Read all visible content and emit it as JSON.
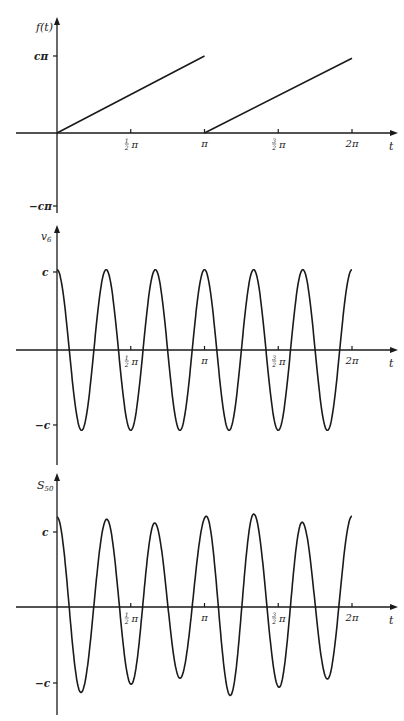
{
  "chart_data": [
    {
      "type": "line",
      "title": "",
      "ylabel": "f(t)",
      "xlabel": "t",
      "x_ticks": [
        "½π",
        "π",
        "3/2π",
        "2π"
      ],
      "y_ticks": [
        "cπ",
        "−cπ"
      ],
      "description": "Sawtooth: f(t) = c·t on [0, π), repeated with period π",
      "series": [
        {
          "name": "f(t) segment 1",
          "x": [
            0,
            3.1416
          ],
          "y": [
            0,
            1.0
          ]
        },
        {
          "name": "f(t) segment 2",
          "x": [
            3.1416,
            6.2832
          ],
          "y": [
            0,
            0.97
          ]
        }
      ],
      "y_units": "multiples of cπ",
      "ylim": [
        -1,
        1.2
      ],
      "xlim": [
        -0.55,
        6.3
      ]
    },
    {
      "type": "line",
      "title": "",
      "ylabel": "v₆",
      "xlabel": "t",
      "x_ticks": [
        "½π",
        "π",
        "3/2π",
        "2π"
      ],
      "y_ticks": [
        "c",
        "−c"
      ],
      "description": "Sinusoid with 6 cycles on [0, 2π], amplitude c",
      "series": [
        {
          "name": "v6",
          "peaks_t": [
            0,
            1.047,
            2.094,
            3.1416,
            4.189,
            5.236,
            6.283
          ],
          "peak_value": 1.0,
          "troughs_t": [
            0.524,
            1.571,
            2.618,
            3.665,
            4.712,
            5.76
          ],
          "trough_value": -1.0
        }
      ],
      "y_units": "multiples of c",
      "ylim": [
        -1.3,
        1.35
      ]
    },
    {
      "type": "line",
      "title": "",
      "ylabel": "S₅₀",
      "xlabel": "t",
      "x_ticks": [
        "½π",
        "π",
        "3/2π",
        "2π"
      ],
      "y_ticks": [
        "c",
        "−c"
      ],
      "description": "Partial sum S50, 6-cycle oscillation with slightly varying amplitude",
      "series": [
        {
          "name": "S50 peaks",
          "t": [
            0,
            1.06,
            2.08,
            3.18,
            4.19,
            5.22,
            6.283
          ],
          "value": [
            1.2,
            1.17,
            1.12,
            1.21,
            1.24,
            1.13,
            1.21
          ]
        },
        {
          "name": "S50 troughs",
          "t": [
            0.51,
            1.58,
            2.62,
            3.69,
            4.73,
            5.76
          ],
          "value": [
            -1.14,
            -1.03,
            -0.95,
            -1.18,
            -1.07,
            -0.96
          ]
        }
      ],
      "y_units": "multiples of c",
      "ylim": [
        -1.45,
        1.75
      ]
    }
  ],
  "labels": {
    "plot1": {
      "ylabel": "f(t)",
      "ytick_top": "cπ",
      "ytick_bottom": "−cπ",
      "xaxis": "t"
    },
    "plot2": {
      "ylabel_main": "v",
      "ylabel_sub": "6",
      "ytick_top": "c",
      "ytick_bottom": "−c",
      "xaxis": "t"
    },
    "plot3": {
      "ylabel_main": "S",
      "ylabel_sub": "50",
      "ytick_top": "c",
      "ytick_bottom": "−c",
      "xaxis": "t"
    },
    "xticks": {
      "half_pi_num": "1",
      "half_pi_den": "2",
      "pi": "π",
      "three_half_num": "3",
      "three_half_den": "2",
      "two_pi": "2π"
    }
  }
}
